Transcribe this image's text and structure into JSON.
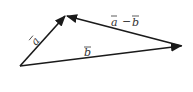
{
  "diagram": {
    "points": {
      "origin": [
        20,
        66
      ],
      "tip_a": [
        66,
        15
      ],
      "tip_b": [
        182,
        46
      ]
    },
    "vectors": [
      {
        "name": "a",
        "label": "a",
        "from": "origin",
        "to": "tip_a"
      },
      {
        "name": "b",
        "label": "b",
        "from": "origin",
        "to": "tip_b"
      },
      {
        "name": "a-b",
        "label": "a − b",
        "from": "tip_b",
        "to": "tip_a"
      }
    ],
    "labels": {
      "a": "a",
      "b": "b",
      "a_minus_b_a": "a",
      "minus": "−",
      "a_minus_b_b": "b"
    },
    "colors": {
      "stroke": "#1a1a1a",
      "label": "#333333"
    }
  }
}
